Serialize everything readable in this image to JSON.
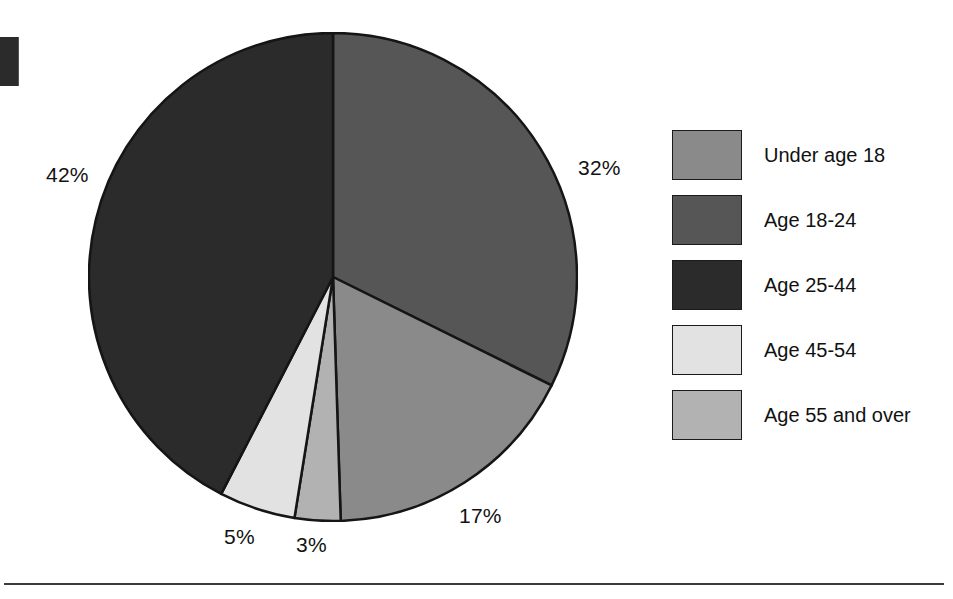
{
  "chart_data": {
    "type": "pie",
    "title": "",
    "subtitle": "",
    "xlabel": "",
    "ylabel": "",
    "legend_position": "right",
    "grid": false,
    "start_angle_deg": 0,
    "direction": "clockwise",
    "categories": [
      "Under age 18",
      "Age 18-24",
      "Age 25-44",
      "Age 45-54",
      "Age 55 and over"
    ],
    "values": [
      17,
      32,
      42,
      5,
      3
    ],
    "unit": "%",
    "slices": [
      {
        "label": "Age 18-24",
        "value": 32,
        "value_label": "32%",
        "color": "#565656",
        "legend_index": 1,
        "order": 1
      },
      {
        "label": "Under age 18",
        "value": 17,
        "value_label": "17%",
        "color": "#8a8a8a",
        "legend_index": 0,
        "order": 2
      },
      {
        "label": "Age 55 and over",
        "value": 3,
        "value_label": "3%",
        "color": "#b2b2b2",
        "legend_index": 4,
        "order": 3
      },
      {
        "label": "Age 45-54",
        "value": 5,
        "value_label": "5%",
        "color": "#e2e2e2",
        "legend_index": 3,
        "order": 4
      },
      {
        "label": "Age 25-44",
        "value": 42,
        "value_label": "42%",
        "color": "#2b2b2b",
        "legend_index": 2,
        "order": 5
      }
    ],
    "data_labels": [
      {
        "name": "pct-32",
        "text": "32%"
      },
      {
        "name": "pct-17",
        "text": "17%"
      },
      {
        "name": "pct-3",
        "text": "3%"
      },
      {
        "name": "pct-5",
        "text": "5%"
      },
      {
        "name": "pct-42",
        "text": "42%"
      }
    ]
  },
  "legend": {
    "items": [
      {
        "label": "Under age 18",
        "color": "#8a8a8a",
        "swatch_name": "legend-swatch-under-age-18"
      },
      {
        "label": "Age 18-24",
        "color": "#565656",
        "swatch_name": "legend-swatch-age-18-24"
      },
      {
        "label": "Age 25-44",
        "color": "#2b2b2b",
        "swatch_name": "legend-swatch-age-25-44"
      },
      {
        "label": "Age 45-54",
        "color": "#e2e2e2",
        "swatch_name": "legend-swatch-age-45-54"
      },
      {
        "label": "Age 55 and over",
        "color": "#b2b2b2",
        "swatch_name": "legend-swatch-age-55-and-over"
      }
    ]
  },
  "geometry": {
    "center_x": 245,
    "center_y": 245,
    "radius": 244,
    "stroke_color": "#151515",
    "stroke_width": 2.5
  }
}
